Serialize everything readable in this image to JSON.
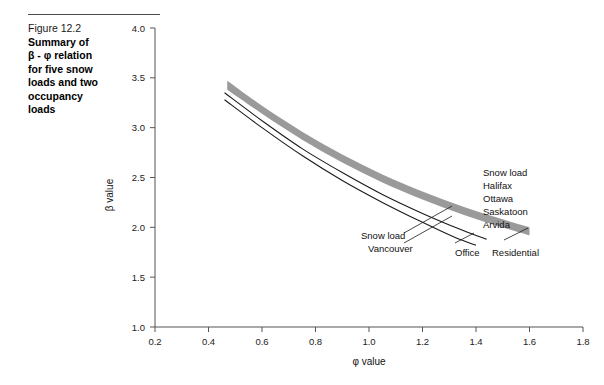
{
  "caption": {
    "number": "Figure 12.2",
    "title_lines": [
      "Summary of",
      "β - φ relation",
      "for five snow",
      "loads and two",
      "occupancy",
      "loads"
    ]
  },
  "colors": {
    "band": "#9a9a9a",
    "line": "#1a1a1a",
    "axis": "#555555",
    "text": "#111111"
  },
  "chart_data": {
    "type": "line",
    "title": "",
    "xlabel": "φ value",
    "ylabel": "β value",
    "xlim": [
      0.2,
      1.8
    ],
    "ylim": [
      1.0,
      4.0
    ],
    "xticks": [
      "0.2",
      "0.4",
      "0.6",
      "0.8",
      "1.0",
      "1.2",
      "1.4",
      "1.6",
      "1.8"
    ],
    "yticks": [
      "1.0",
      "1.5",
      "2.0",
      "2.5",
      "3.0",
      "3.5",
      "4.0"
    ],
    "grid": false,
    "legend_position": "inline-annotations",
    "series": [
      {
        "name": "Snow load band (Halifax, Ottawa, Saskatoon, Arvida) - upper edge",
        "style": "band-edge",
        "x": [
          0.47,
          0.6,
          0.75,
          0.9,
          1.05,
          1.2,
          1.35,
          1.5,
          1.6
        ],
        "y": [
          3.47,
          3.22,
          2.96,
          2.73,
          2.53,
          2.36,
          2.21,
          2.08,
          2.0
        ]
      },
      {
        "name": "Snow load band (Halifax, Ottawa, Saskatoon, Arvida) - lower edge",
        "style": "band-edge",
        "x": [
          0.47,
          0.6,
          0.75,
          0.9,
          1.05,
          1.2,
          1.35,
          1.5,
          1.6
        ],
        "y": [
          3.38,
          3.14,
          2.88,
          2.65,
          2.45,
          2.28,
          2.13,
          2.0,
          1.92
        ]
      },
      {
        "name": "Residential",
        "style": "thin-line",
        "x": [
          0.46,
          0.6,
          0.75,
          0.9,
          1.05,
          1.2,
          1.35,
          1.44
        ],
        "y": [
          3.35,
          3.07,
          2.79,
          2.55,
          2.33,
          2.14,
          1.97,
          1.88
        ]
      },
      {
        "name": "Office",
        "style": "thin-line",
        "x": [
          0.46,
          0.6,
          0.75,
          0.9,
          1.05,
          1.2,
          1.32,
          1.4
        ],
        "y": [
          3.28,
          3.0,
          2.72,
          2.47,
          2.25,
          2.05,
          1.9,
          1.82
        ]
      }
    ],
    "annotations": [
      {
        "name": "snow-load-group-label",
        "lines": [
          "Snow load",
          "  Halifax",
          "  Ottawa",
          "  Saskatoon",
          "  Arvida"
        ],
        "x": 1.44,
        "y": 2.78
      },
      {
        "name": "vancouver-label",
        "lines": [
          "Snow load",
          "Vancouver"
        ],
        "x": 0.93,
        "y": 1.93
      },
      {
        "name": "office-label",
        "lines": [
          "Office"
        ],
        "x": 1.37,
        "y": 1.73
      },
      {
        "name": "residential-label",
        "lines": [
          "Residential"
        ],
        "x": 1.55,
        "y": 1.73
      }
    ]
  }
}
